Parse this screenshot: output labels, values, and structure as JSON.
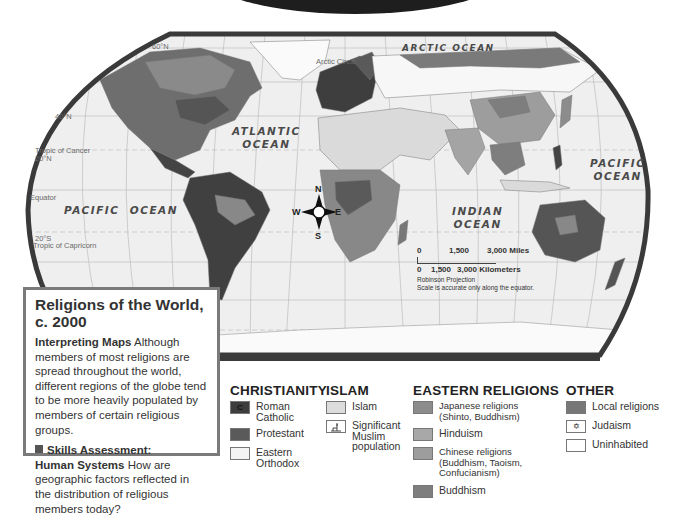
{
  "map": {
    "title": "Religions of the World, c. 2000",
    "ocean_labels": {
      "arctic": "ARCTIC OCEAN",
      "atlantic_line1": "ATLANTIC",
      "atlantic_line2": "OCEAN",
      "pacific_west": "PACIFIC  OCEAN",
      "pacific_east_line1": "PACIFIC",
      "pacific_east_line2": "OCEAN",
      "indian_line1": "INDIAN",
      "indian_line2": "OCEAN"
    },
    "lines": {
      "arctic_circle": "Arctic Circle",
      "tropic_cancer": "Tropic of Cancer",
      "equator": "Equator",
      "tropic_capricorn": "Tropic of Capricorn"
    },
    "latitude_labels": [
      "60°N",
      "40°N",
      "20°N",
      "20°S"
    ],
    "longitude_labels": [
      "80°W",
      "60°W",
      "40°W",
      "20°W",
      "0°",
      "20°E",
      "40°E",
      "60°E",
      "80°E",
      "100°E",
      "120°E",
      "140°E",
      "160°E"
    ],
    "compass": {
      "n": "N",
      "s": "S",
      "e": "E",
      "w": "W"
    },
    "scale": {
      "miles": [
        "0",
        "1,500",
        "3,000 Miles"
      ],
      "kilometers": [
        "0",
        "1,500",
        "3,000 Kilometers"
      ],
      "projection": "Robinson Projection",
      "note": "Scale is accurate only along the equator."
    }
  },
  "info_box": {
    "title": "Religions of the World, c. 2000",
    "interpreting_label": "Interpreting Maps",
    "interpreting_text": "Although members of most religions are spread throughout the world, different regions of the globe tend to be more heavily populated by members of certain religious groups.",
    "skills_label": "Skills Assessment:",
    "human_systems_label": "Human Systems",
    "question": "How are geographic factors reflected in the distribution of religious members today?"
  },
  "legend": {
    "christianity": {
      "title": "CHRISTIANITY",
      "items": [
        {
          "label": "Roman Catholic",
          "swatch_text": "C",
          "color": "#3d3d3d"
        },
        {
          "label": "Protestant",
          "color": "#5a5a5a"
        },
        {
          "label": "Eastern Orthodox",
          "color": "#f4f4f4"
        }
      ]
    },
    "islam": {
      "title": "ISLAM",
      "items": [
        {
          "label": "Islam",
          "color": "#dcdcdc"
        },
        {
          "label": "Significant Muslim population",
          "color": "#ffffff"
        }
      ]
    },
    "eastern": {
      "title": "EASTERN RELIGIONS",
      "items": [
        {
          "label": "Japanese religions (Shinto, Buddhism)",
          "color": "#8c8c8c"
        },
        {
          "label": "Hinduism",
          "color": "#a8a8a8"
        },
        {
          "label": "Chinese religions (Buddhism, Taoism, Confucianism)",
          "color": "#9d9d9d"
        },
        {
          "label": "Buddhism",
          "color": "#7e7e7e"
        }
      ]
    },
    "other": {
      "title": "OTHER",
      "items": [
        {
          "label": "Local religions",
          "color": "#777777"
        },
        {
          "label": "Judaism",
          "swatch_text": "✡",
          "color": "#ffffff"
        },
        {
          "label": "Uninhabited",
          "color": "#ffffff"
        }
      ]
    }
  }
}
